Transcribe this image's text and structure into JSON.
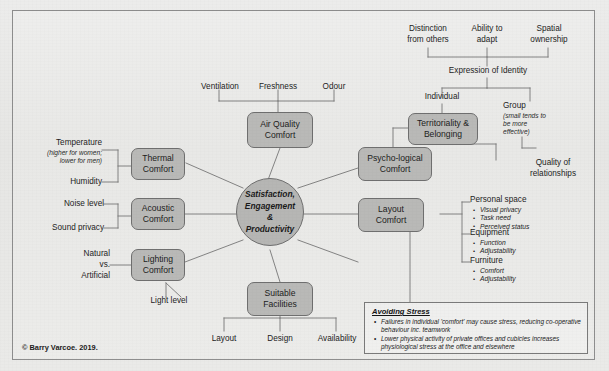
{
  "diagram": {
    "copyright": "© Barry Varcoe. 2019.",
    "colors": {
      "box_fill": "#b9b9b7",
      "box_border": "#6f6f6f",
      "background": "#e8e8e6",
      "text": "#1d1d1d"
    }
  },
  "center": {
    "line1": "Satisfaction,",
    "line2": "Engagement",
    "line3": "&",
    "line4": "Productivity"
  },
  "nodes": {
    "air_quality": "Air Quality\nComfort",
    "thermal": "Thermal\nComfort",
    "acoustic": "Acoustic\nComfort",
    "lighting": "Lighting\nComfort",
    "suitable_facilities": "Suitable\nFacilities",
    "psychological": "Psycho-logical\nComfort",
    "territoriality": "Territoriality &\nBelonging",
    "layout": "Layout\nComfort"
  },
  "air_quality_drivers": [
    "Ventilation",
    "Freshness",
    "Odour"
  ],
  "thermal_drivers": {
    "temperature": "Temperature",
    "temperature_note_line1": "(higher for women;",
    "temperature_note_line2": "lower for men)",
    "humidity": "Humidity"
  },
  "acoustic_drivers": [
    "Noise level",
    "Sound privacy"
  ],
  "lighting_drivers": {
    "natural": "Natural",
    "vs": "vs.",
    "artificial": "Artificial",
    "light_level": "Light level"
  },
  "facilities_drivers": [
    "Layout",
    "Design",
    "Availability"
  ],
  "identity": {
    "drivers": [
      "Distinction\nfrom others",
      "Ability to\nadapt",
      "Spatial\nownership"
    ],
    "driver_1_line1": "Distinction",
    "driver_1_line2": "from others",
    "driver_2_line1": "Ability to",
    "driver_2_line2": "adapt",
    "driver_3_line1": "Spatial",
    "driver_3_line2": "ownership",
    "expression": "Expression of Identity",
    "individual": "Individual",
    "group": "Group",
    "group_note_line1": "(small tends to",
    "group_note_line2": "be more",
    "group_note_line3": "effective)",
    "quality_line1": "Quality of",
    "quality_line2": "relationships"
  },
  "layout_details": [
    {
      "head": "Personal space",
      "items": [
        "Visual privacy",
        "Task need",
        "Perceived status"
      ]
    },
    {
      "head": "Equipment",
      "items": [
        "Function",
        "Adjustability"
      ]
    },
    {
      "head": "Furniture",
      "items": [
        "Comfort",
        "Adjustability"
      ]
    }
  ],
  "avoiding_stress": {
    "title": "Avoiding Stress",
    "points": [
      "Failures in individual 'comfort' may cause stress, reducing co-operative behaviour inc. teamwork",
      "Lower physical activity of private offices and cubicles increases physiological stress at the office and elsewhere"
    ]
  }
}
